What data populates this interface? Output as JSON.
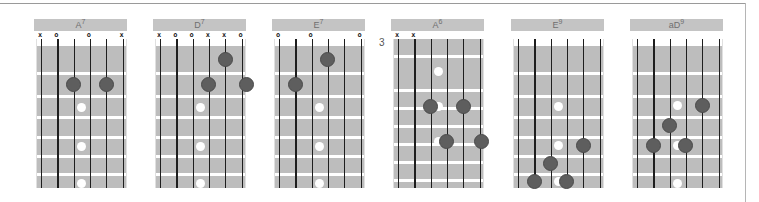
{
  "colors": {
    "title_bg": "#c4c4c4",
    "fretboard": "#bdbdbd",
    "finger_dot": "#5e5e5e",
    "inlay": "#ffffff",
    "string": "#1e1e1e"
  },
  "chords": [
    {
      "name": "A",
      "sup": "7",
      "left": 34,
      "nut": true,
      "fret_label": "",
      "markers": [
        {
          "s": 0,
          "t": "x"
        },
        {
          "s": 1,
          "t": "o"
        },
        {
          "s": 3,
          "t": "o"
        },
        {
          "s": 5,
          "t": "x"
        }
      ],
      "frets": [
        33,
        56,
        77,
        97,
        116,
        134
      ],
      "dots": [
        {
          "s": 2,
          "y": 45
        },
        {
          "s": 4,
          "y": 45
        }
      ],
      "inlays": [
        {
          "x": 2.5,
          "y": 68
        },
        {
          "x": 2.5,
          "y": 107
        },
        {
          "x": 2.5,
          "y": 144
        }
      ]
    },
    {
      "name": "D",
      "sup": "7",
      "left": 153,
      "nut": true,
      "fret_label": "",
      "markers": [
        {
          "s": 0,
          "t": "x"
        },
        {
          "s": 1,
          "t": "o"
        },
        {
          "s": 2,
          "t": "o"
        },
        {
          "s": 3,
          "t": "x"
        },
        {
          "s": 4,
          "t": "x"
        },
        {
          "s": 5,
          "t": "o"
        }
      ],
      "frets": [
        33,
        56,
        77,
        97,
        116,
        134
      ],
      "dots": [
        {
          "s": 4,
          "y": 20
        },
        {
          "s": 3,
          "y": 45
        },
        {
          "s": 5.3,
          "y": 45
        }
      ],
      "inlays": [
        {
          "x": 2.5,
          "y": 68
        },
        {
          "x": 2.5,
          "y": 107
        },
        {
          "x": 2.5,
          "y": 144
        }
      ]
    },
    {
      "name": "E",
      "sup": "7",
      "left": 272,
      "nut": true,
      "fret_label": "",
      "markers": [
        {
          "s": 0,
          "t": "o"
        },
        {
          "s": 2,
          "t": "o"
        },
        {
          "s": 5,
          "t": "o"
        }
      ],
      "frets": [
        33,
        56,
        77,
        97,
        116,
        134
      ],
      "dots": [
        {
          "s": 3,
          "y": 20
        },
        {
          "s": 1,
          "y": 45
        }
      ],
      "inlays": [
        {
          "x": 2.5,
          "y": 68
        },
        {
          "x": 2.5,
          "y": 107
        },
        {
          "x": 2.5,
          "y": 144
        }
      ]
    },
    {
      "name": "A",
      "sup": "6",
      "left": 391,
      "nut": false,
      "fret_label": "3",
      "markers": [
        {
          "s": 0,
          "t": "x"
        },
        {
          "s": 1,
          "t": "x"
        }
      ],
      "frets": [
        16,
        50,
        68,
        86,
        104,
        122,
        140
      ],
      "dots": [
        {
          "s": 2,
          "y": 67
        },
        {
          "s": 4,
          "y": 67
        },
        {
          "s": 3,
          "y": 102
        },
        {
          "s": 5.1,
          "y": 102
        }
      ],
      "inlays": [
        {
          "x": 2.5,
          "y": 32
        },
        {
          "x": 2.5,
          "y": 67
        },
        {
          "x": 2.5,
          "y": 102
        }
      ]
    },
    {
      "name": "E",
      "sup": "9",
      "left": 511,
      "nut": true,
      "fret_label": "",
      "markers": [],
      "frets": [
        33,
        56,
        77,
        97,
        116,
        134
      ],
      "dots": [
        {
          "s": 4,
          "y": 106
        },
        {
          "s": 2,
          "y": 124
        },
        {
          "s": 1,
          "y": 142
        },
        {
          "s": 3,
          "y": 142
        }
      ],
      "inlays": [
        {
          "x": 2.5,
          "y": 67
        },
        {
          "x": 2.5,
          "y": 106
        },
        {
          "x": 2.5,
          "y": 142
        }
      ]
    },
    {
      "name": "aD",
      "sup": "9",
      "left": 630,
      "nut": true,
      "fret_label": "",
      "markers": [],
      "frets": [
        33,
        56,
        77,
        97,
        116,
        134
      ],
      "dots": [
        {
          "s": 4,
          "y": 66
        },
        {
          "s": 2,
          "y": 86
        },
        {
          "s": 1,
          "y": 106
        },
        {
          "s": 3,
          "y": 106
        }
      ],
      "inlays": [
        {
          "x": 2.5,
          "y": 66
        },
        {
          "x": 2.5,
          "y": 106
        },
        {
          "x": 2.5,
          "y": 144
        }
      ]
    }
  ]
}
